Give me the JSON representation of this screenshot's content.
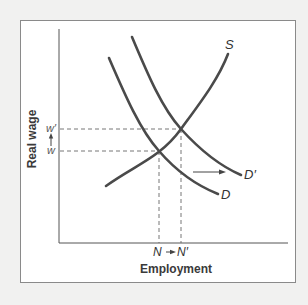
{
  "diagram": {
    "title": "",
    "y_axis_label": "Real wage",
    "x_axis_label": "Employment",
    "curves": [
      {
        "name": "S",
        "label": "S",
        "type": "supply",
        "start": [
          106,
          186
        ],
        "end": [
          228,
          54
        ]
      },
      {
        "name": "D",
        "label": "D",
        "type": "demand",
        "start": [
          109,
          58
        ],
        "end": [
          218,
          194
        ]
      },
      {
        "name": "D'",
        "label": "D′",
        "type": "demand-shifted",
        "start": [
          132,
          37
        ],
        "end": [
          241,
          175
        ]
      }
    ],
    "y_ticks": {
      "w_prime": "w′",
      "w": "w",
      "arrow": "↑"
    },
    "x_ticks": {
      "n": "N",
      "arrow": "→",
      "n_prime": "N′"
    },
    "equilibria": [
      {
        "name": "initial",
        "wage": "w",
        "employment": "N",
        "point": [
          159,
          151
        ]
      },
      {
        "name": "new",
        "wage": "w′",
        "employment": "N′",
        "point": [
          181,
          129
        ]
      }
    ],
    "shift_arrow": {
      "from": [
        193,
        172
      ],
      "to": [
        225,
        172
      ],
      "direction": "right"
    },
    "colors": {
      "curve": "#4a4a4a",
      "axis": "#555555",
      "frame": "#8a8a8a",
      "background_outer": "#f1f1f0",
      "background_inner": "#ffffff"
    }
  }
}
